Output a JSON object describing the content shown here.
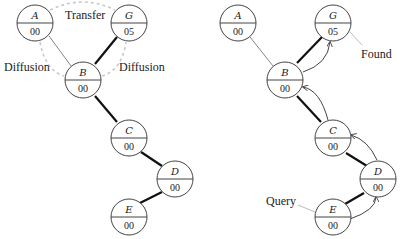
{
  "left_diagram": {
    "nodes": {
      "A": {
        "label": "A",
        "value": "00"
      },
      "G": {
        "label": "G",
        "value": "05"
      },
      "B": {
        "label": "B",
        "value": "00"
      },
      "C": {
        "label": "C",
        "value": "00"
      },
      "D": {
        "label": "D",
        "value": "00"
      },
      "E": {
        "label": "E",
        "value": "00"
      }
    },
    "annotations": {
      "transfer": "Transfer",
      "diffusion_left": "Diffusion",
      "diffusion_right": "Diffusion"
    }
  },
  "right_diagram": {
    "nodes": {
      "A": {
        "label": "A",
        "value": "00"
      },
      "G": {
        "label": "G",
        "value": "05"
      },
      "B": {
        "label": "B",
        "value": "00"
      },
      "C": {
        "label": "C",
        "value": "00"
      },
      "D": {
        "label": "D",
        "value": "00"
      },
      "E": {
        "label": "E",
        "value": "00"
      }
    },
    "annotations": {
      "found": "Found",
      "query": "Query"
    }
  },
  "colors": {
    "thick_edge": "#111111",
    "thin_edge": "#666666",
    "dashed_arc": "#c8c8c8"
  }
}
